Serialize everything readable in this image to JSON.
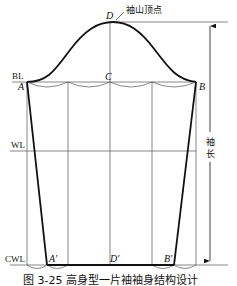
{
  "figure": {
    "caption": "图 3-25  高身型一片袖袖身结构设计",
    "top_label": "袖山顶点",
    "side_label": "袖长",
    "lines": {
      "bl": "BL",
      "wl": "WL",
      "cwl": "CWL"
    },
    "points": {
      "D": "D",
      "C": "C",
      "A": "A",
      "B": "B",
      "A_prime": "A′",
      "D_prime": "D′",
      "B_prime": "B′"
    }
  },
  "colors": {
    "stroke": "#111111",
    "thin": "#555555",
    "background": "#ffffff"
  }
}
